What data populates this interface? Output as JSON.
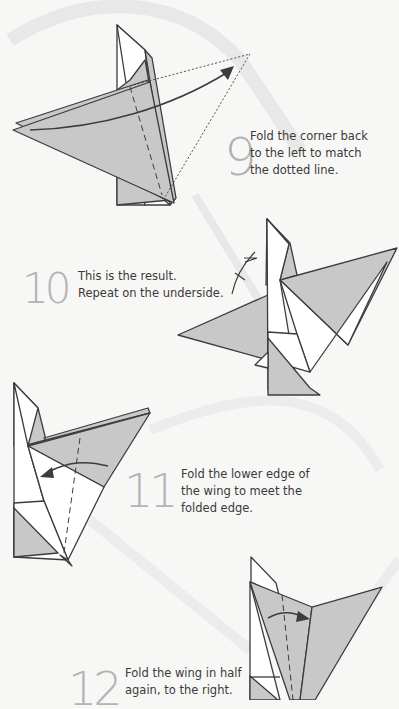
{
  "colors": {
    "background": "#f7f7f6",
    "paper_gray": "#c8c8c8",
    "paper_white": "#ffffff",
    "outline": "#3c3c3c",
    "step_number": "#b4b4b4",
    "ribbon": "#e6e6e6"
  },
  "steps": [
    {
      "number": "9",
      "lines": [
        "Fold the corner back",
        "to the left to match",
        "the dotted line."
      ],
      "diagram": "fold-corner-back-left"
    },
    {
      "number": "10",
      "lines": [
        "This is the result.",
        "Repeat on the underside."
      ],
      "diagram": "result-repeat-underside",
      "symbol": "repeat-on-underside-icon"
    },
    {
      "number": "11",
      "lines": [
        "Fold the lower edge of",
        "the wing to meet the",
        "folded edge."
      ],
      "diagram": "fold-lower-edge-wing"
    },
    {
      "number": "12",
      "lines": [
        "Fold the wing in half",
        "again, to the right."
      ],
      "diagram": "fold-wing-half-right"
    }
  ]
}
